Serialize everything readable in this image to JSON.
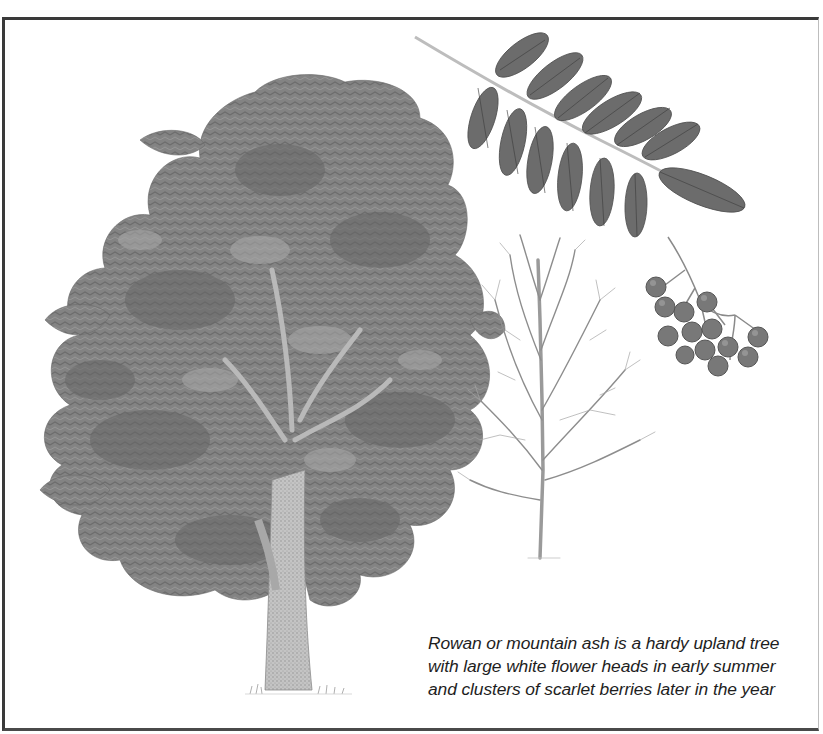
{
  "plate": {
    "subject": "Rowan (mountain ash)",
    "caption": {
      "lines": [
        "Rowan or mountain ash is a hardy upland tree",
        "with large white flower heads in early summer",
        "and clusters of scarlet berries later in the year"
      ]
    },
    "illustrations": [
      {
        "id": "summer-tree",
        "label": "Rowan tree in full leaf"
      },
      {
        "id": "winter-tree",
        "label": "Rowan tree in winter (bare branches)"
      },
      {
        "id": "compound-leaf",
        "label": "Pinnate compound leaf",
        "leaflet_count": 13
      },
      {
        "id": "berry-cluster",
        "label": "Cluster of berries",
        "berry_count": 13
      }
    ],
    "colors": {
      "border": "#3a3a3a",
      "foliage": "#7a7a7a",
      "foliage_dark": "#5e5e5e",
      "leaflet": "#6a6a6a",
      "berry": "#767676",
      "trunk": "#b0b0b0",
      "caption_text": "#1e1e1e"
    }
  }
}
